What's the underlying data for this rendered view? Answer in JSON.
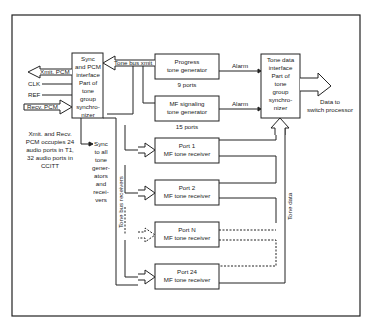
{
  "diagram": {
    "sync_box": {
      "lines": [
        "Sync",
        "and PCM",
        "interface",
        "Part of",
        "tone",
        "group",
        "synchro-",
        "nizer"
      ]
    },
    "inputs": {
      "xmit_pcm": "Xmit. PCM",
      "clk": "CLK",
      "ref": "REF",
      "recv_pcm": "Recv. PCM"
    },
    "note": {
      "lines": [
        "Xmit. and Recv.",
        "PCM occupies 24",
        "audio ports in T1,",
        "32 audio ports in",
        "CCITT"
      ]
    },
    "sync_note": {
      "lines": [
        "Sync",
        "to all",
        "tone",
        "gener-",
        "ators",
        "and",
        "recei-",
        "vers"
      ]
    },
    "tone_bus_xmit": "Tone bus xmit",
    "tone_bus_receivers": "Tone bus receivers",
    "tone_data": "Tone data",
    "progress_gen": {
      "line1": "Progress",
      "line2": "tone generator",
      "ports": "9 ports"
    },
    "mf_signaling_gen": {
      "line1": "MF signaling",
      "line2": "tone generator",
      "ports": "15 ports"
    },
    "alarm1": "Alarm",
    "alarm2": "Alarm",
    "tone_data_box": {
      "lines": [
        "Tone data",
        "interface",
        "Part of",
        "tone",
        "group",
        "synchro-",
        "nizer"
      ]
    },
    "output": {
      "line1": "Data to",
      "line2": "switch processor"
    },
    "receivers": [
      {
        "line1": "Port 1",
        "line2": "MF tone receiver"
      },
      {
        "line1": "Port 2",
        "line2": "MF tone receiver"
      },
      {
        "line1": "Port N",
        "line2": "MF tone receiver"
      },
      {
        "line1": "Port 24",
        "line2": "MF tone receiver"
      }
    ]
  }
}
